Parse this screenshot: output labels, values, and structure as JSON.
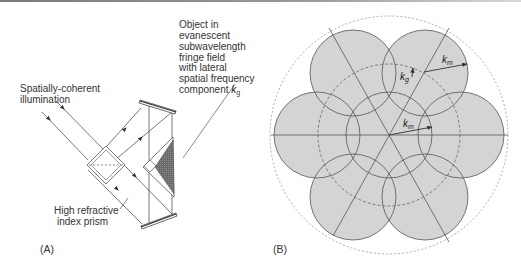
{
  "figure": {
    "panel_a": {
      "label": "(A)",
      "illumination_label": [
        "Spatially-coherent",
        "illumination"
      ],
      "object_label": [
        "Object in",
        "evanescent",
        "subwavelength",
        "fringe field",
        "with lateral",
        "spatial frequency",
        "component "
      ],
      "object_label_symbol": "k",
      "object_label_subscript": "g",
      "prism_label": [
        "High refractive",
        "index prism"
      ]
    },
    "panel_b": {
      "label": "(B)",
      "km_outer_symbol": "k",
      "km_outer_subscript": "m",
      "kg_symbol": "k",
      "kg_subscript": "g",
      "km_inner_symbol": "k",
      "km_inner_subscript": "m",
      "colors": {
        "disc_fill": "#d4d4d4",
        "stroke": "#555555"
      }
    }
  }
}
